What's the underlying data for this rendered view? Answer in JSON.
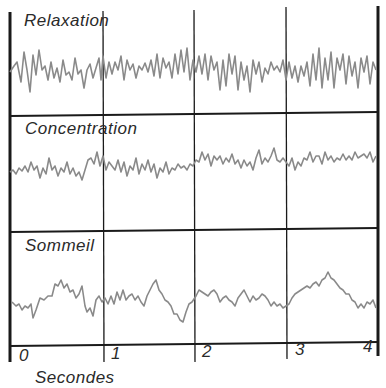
{
  "panels": [
    {
      "label": "Relaxation"
    },
    {
      "label": "Concentration"
    },
    {
      "label": "Sommeil"
    }
  ],
  "axis": {
    "ticks": [
      "0",
      "1",
      "2",
      "3",
      "4"
    ],
    "unit_label": "Secondes"
  },
  "colors": {
    "grid": "#1a1a1a",
    "trace": "#8a8a8a",
    "text": "#2a2a2a"
  }
}
